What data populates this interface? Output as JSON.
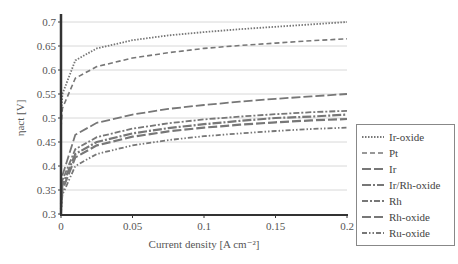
{
  "chart_data": {
    "type": "line",
    "title": "",
    "xlabel": "Current density [A cm⁻²]",
    "ylabel": "ηact [V]",
    "xlim": [
      0,
      0.2
    ],
    "ylim": [
      0.3,
      0.72
    ],
    "x_ticks": [
      "0",
      "0.05",
      "0.1",
      "0.15",
      "0.2"
    ],
    "y_ticks": [
      "0.3",
      "0.35",
      "0.4",
      "0.45",
      "0.5",
      "0.55",
      "0.6",
      "0.65",
      "0.7"
    ],
    "grid": "horizontal",
    "legend_position": "right",
    "x": [
      0,
      0.001,
      0.01,
      0.025,
      0.05,
      0.075,
      0.1,
      0.125,
      0.15,
      0.175,
      0.2
    ],
    "series": [
      {
        "name": "Ir-oxide",
        "style": "dotted",
        "values": [
          0.5,
          0.55,
          0.62,
          0.645,
          0.662,
          0.672,
          0.679,
          0.685,
          0.69,
          0.695,
          0.7
        ]
      },
      {
        "name": "Pt",
        "style": "dashed",
        "values": [
          0.48,
          0.52,
          0.583,
          0.607,
          0.625,
          0.636,
          0.645,
          0.651,
          0.656,
          0.661,
          0.665
        ]
      },
      {
        "name": "Ir",
        "style": "long-dash",
        "values": [
          0.33,
          0.38,
          0.465,
          0.49,
          0.507,
          0.519,
          0.527,
          0.534,
          0.54,
          0.545,
          0.55
        ]
      },
      {
        "name": "Ir/Rh-oxide",
        "style": "long-dash-dot",
        "values": [
          0.32,
          0.36,
          0.425,
          0.45,
          0.468,
          0.479,
          0.487,
          0.494,
          0.5,
          0.503,
          0.507
        ]
      },
      {
        "name": "Rh",
        "style": "dash-dot",
        "values": [
          0.33,
          0.37,
          0.435,
          0.46,
          0.478,
          0.489,
          0.497,
          0.503,
          0.508,
          0.512,
          0.515
        ]
      },
      {
        "name": "Rh-oxide",
        "style": "long-dash",
        "values": [
          0.31,
          0.35,
          0.418,
          0.443,
          0.461,
          0.472,
          0.48,
          0.486,
          0.491,
          0.495,
          0.498
        ]
      },
      {
        "name": "Ru-oxide",
        "style": "dash-dot-dot",
        "values": [
          0.3,
          0.34,
          0.4,
          0.425,
          0.443,
          0.454,
          0.462,
          0.468,
          0.473,
          0.477,
          0.48
        ]
      }
    ]
  },
  "legend": {
    "items": [
      {
        "label": "Ir-oxide"
      },
      {
        "label": "Pt"
      },
      {
        "label": "Ir"
      },
      {
        "label": "Ir/Rh-oxide"
      },
      {
        "label": "Rh"
      },
      {
        "label": "Rh-oxide"
      },
      {
        "label": "Ru-oxide"
      }
    ]
  },
  "colors": {
    "axis": "#333333",
    "grid": "#d8d8d8",
    "series": "#777777"
  }
}
